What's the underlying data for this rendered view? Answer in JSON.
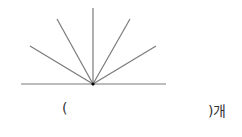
{
  "diagram": {
    "line_color": "#7a7a7a",
    "point_color": "#000000",
    "center": {
      "x": 93,
      "y": 84
    },
    "baseline": {
      "x1": 21,
      "y1": 84,
      "x2": 166,
      "y2": 84
    },
    "rays": [
      {
        "name": "ray-far-left",
        "x": 30,
        "y": 46
      },
      {
        "name": "ray-upper-left",
        "x": 57,
        "y": 19
      },
      {
        "name": "ray-vertical",
        "x": 93,
        "y": 8
      },
      {
        "name": "ray-upper-right",
        "x": 130,
        "y": 19
      },
      {
        "name": "ray-far-right",
        "x": 156,
        "y": 46
      }
    ]
  },
  "answer": {
    "open_paren": "(",
    "close_paren_with_unit": ")개"
  }
}
